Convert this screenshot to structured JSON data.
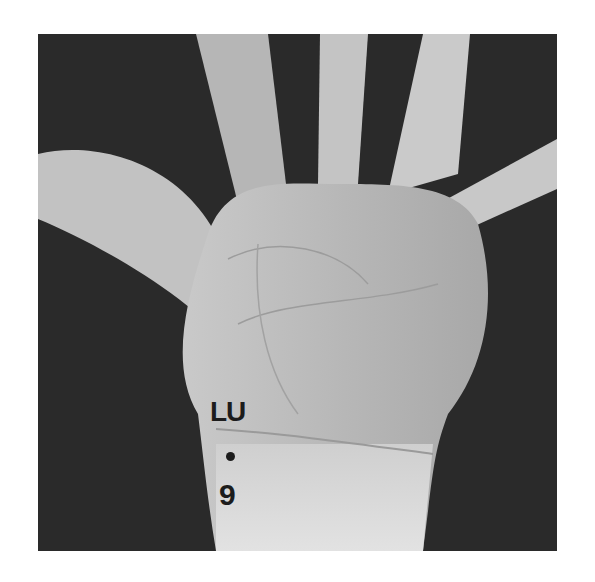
{
  "figure": {
    "point": {
      "meridian_label": "LU",
      "number_label": "9",
      "marker": "dot"
    },
    "colors": {
      "background": "#2a2a2a",
      "skin_light": "#d8d8d8",
      "skin_mid": "#b4b4b4",
      "label": "#1c1c1c",
      "page": "#ffffff"
    }
  }
}
